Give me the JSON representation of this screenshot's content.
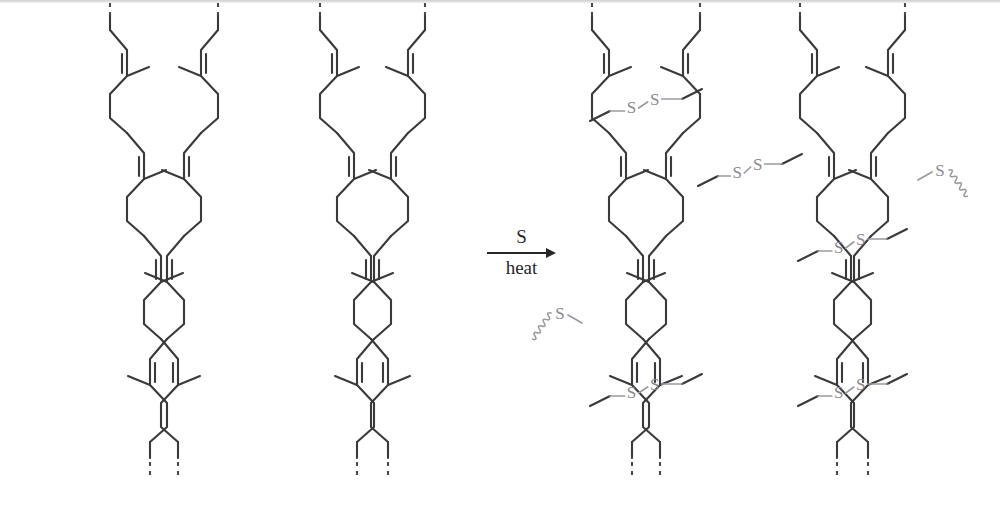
{
  "figure": {
    "background_color": "#ffffff",
    "bond_color": "#3a3a3c",
    "sulfur_color": "#8a8a8e",
    "text_color": "#262628",
    "width": 1000,
    "height": 506
  },
  "reaction": {
    "above_arrow_label": "S",
    "below_arrow_label": "heat",
    "arrow_direction": "right",
    "arrow_x_start": 487,
    "arrow_x_end": 556,
    "arrow_y": 253
  },
  "left_panel": {
    "name": "unvulcanized-rubber",
    "description": "Four parallel cis-1,4-polyisoprene chains with no cross-links",
    "chain_count": 4,
    "chains": [
      {
        "id": "chain-1",
        "x": 110,
        "y_top": 30,
        "mirrored": false,
        "phase": 0
      },
      {
        "id": "chain-2",
        "x": 218,
        "y_top": 30,
        "mirrored": true,
        "phase": 1
      },
      {
        "id": "chain-3",
        "x": 320,
        "y_top": 30,
        "mirrored": false,
        "phase": 0
      },
      {
        "id": "chain-4",
        "x": 425,
        "y_top": 30,
        "mirrored": true,
        "phase": 1
      }
    ],
    "terminal_style": "dashed-bond-continuation",
    "repeat_unit": "isoprene",
    "repeat_height": 103
  },
  "right_panel": {
    "name": "vulcanized-rubber",
    "description": "Four polyisoprene chains joined by disulfide (S-S) cross-links",
    "chain_count": 4,
    "chains": [
      {
        "id": "chain-1",
        "x": 592,
        "y_top": 30,
        "mirrored": false,
        "phase": 0
      },
      {
        "id": "chain-2",
        "x": 700,
        "y_top": 30,
        "mirrored": true,
        "phase": 1
      },
      {
        "id": "chain-3",
        "x": 800,
        "y_top": 30,
        "mirrored": false,
        "phase": 0
      },
      {
        "id": "chain-4",
        "x": 905,
        "y_top": 30,
        "mirrored": true,
        "phase": 1
      }
    ],
    "crosslinks": [
      {
        "id": "xlink-1",
        "label_left": "S",
        "label_right": "S",
        "from_chain": 1,
        "to_chain": 2,
        "y": 105
      },
      {
        "id": "xlink-2",
        "label_left": "S",
        "label_right": "S",
        "from_chain": 2,
        "to_chain": 3,
        "y": 170
      },
      {
        "id": "xlink-3",
        "label_left": "S",
        "label_right": "S",
        "from_chain": 3,
        "to_chain": 4,
        "y": 245
      },
      {
        "id": "xlink-4",
        "label_left": "S",
        "label_right": "S",
        "from_chain": 1,
        "to_chain": 2,
        "y": 390
      },
      {
        "id": "xlink-5",
        "label_left": "S",
        "label_right": "S",
        "from_chain": 3,
        "to_chain": 4,
        "y": 390
      }
    ],
    "dangling_sulfurs": [
      {
        "id": "dangling-s-left",
        "label": "S",
        "x": 560,
        "y": 315,
        "side": "left",
        "note": "squiggly bond to further network"
      },
      {
        "id": "dangling-s-right",
        "label": "S",
        "x": 940,
        "y": 172,
        "side": "right",
        "note": "squiggly bond to further network"
      }
    ],
    "terminal_style": "dashed-bond-continuation"
  }
}
